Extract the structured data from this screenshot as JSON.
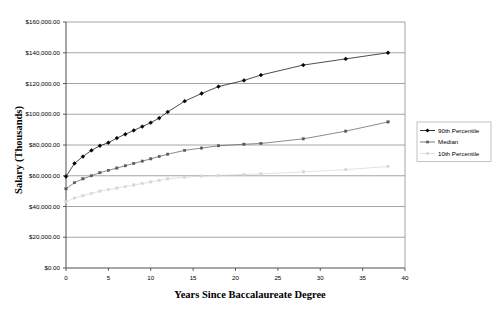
{
  "chart_data": {
    "type": "line",
    "title": "",
    "xlabel": "Years Since Baccalaureate Degree",
    "ylabel": "Salary (Thousands)",
    "xlim": [
      0,
      40
    ],
    "ylim": [
      0,
      160000
    ],
    "grid": true,
    "legend_position": "right",
    "x_ticks": [
      0,
      5,
      10,
      15,
      20,
      25,
      30,
      35,
      40
    ],
    "x_tick_labels": [
      "0",
      "5",
      "10",
      "15",
      "20",
      "25",
      "30",
      "35",
      "40"
    ],
    "y_ticks": [
      0,
      20000,
      40000,
      60000,
      80000,
      100000,
      120000,
      140000,
      160000
    ],
    "y_tick_labels": [
      "$0.00",
      "$20,000.00",
      "$40,000.00",
      "$60,000.00",
      "$80,000.00",
      "$100,000.00",
      "$120,000.00",
      "$140,000.00",
      "$160,000.00"
    ],
    "x": [
      0,
      1,
      2,
      3,
      4,
      5,
      6,
      7,
      8,
      9,
      10,
      11,
      12,
      14,
      16,
      18,
      21,
      23,
      28,
      33,
      38
    ],
    "series": [
      {
        "name": "90th Percentile",
        "color": "#000000",
        "marker": "diamond",
        "values": [
          59500,
          68000,
          72500,
          76500,
          79500,
          81500,
          84500,
          87000,
          89500,
          92000,
          94500,
          97500,
          101500,
          108500,
          113500,
          118000,
          122000,
          125500,
          132000,
          136000,
          140000
        ]
      },
      {
        "name": "Median",
        "color": "#595959",
        "marker": "square",
        "values": [
          51500,
          55500,
          58000,
          60000,
          62000,
          63500,
          65000,
          66500,
          68000,
          69500,
          71000,
          72500,
          74000,
          76500,
          78000,
          79500,
          80500,
          81000,
          84000,
          89000,
          95000
        ]
      },
      {
        "name": "10th Percentile",
        "color": "#d6d6d6",
        "marker": "square",
        "values": [
          43000,
          45500,
          47000,
          48500,
          50000,
          51000,
          52000,
          53000,
          54000,
          55000,
          56000,
          57000,
          58000,
          59000,
          59800,
          60200,
          60800,
          61200,
          62500,
          64000,
          66000
        ]
      }
    ]
  },
  "legend": {
    "items": [
      {
        "label": "90th Percentile"
      },
      {
        "label": "Median"
      },
      {
        "label": "10th Percentile"
      }
    ]
  }
}
